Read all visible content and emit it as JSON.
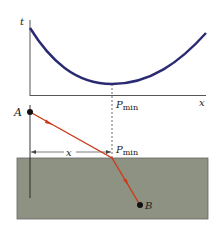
{
  "graph": {
    "y_axis_label": "t",
    "x_axis_label": "x",
    "min_label": "P",
    "min_label_sub": "min",
    "curve_color": "#2a2a72"
  },
  "refraction": {
    "point_a_label": "A",
    "point_b_label": "B",
    "distance_label": "x",
    "interface_label": "P",
    "interface_label_sub": "min",
    "ray_color": "#cc3a1a",
    "medium_color": "#8d9282"
  }
}
